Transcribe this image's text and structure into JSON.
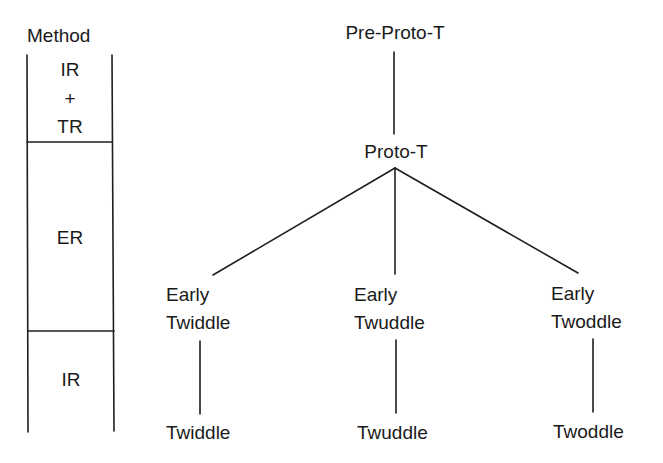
{
  "method_column": {
    "header": "Method",
    "cells": [
      {
        "lines": [
          "IR",
          "+",
          "TR"
        ]
      },
      {
        "lines": [
          "ER"
        ]
      },
      {
        "lines": [
          "IR"
        ]
      }
    ]
  },
  "tree": {
    "root": "Pre-Proto-T",
    "proto": "Proto-T",
    "branches": [
      {
        "early_line1": "Early",
        "early_line2": "Twiddle",
        "leaf": "Twiddle"
      },
      {
        "early_line1": "Early",
        "early_line2": "Twuddle",
        "leaf": "Twuddle"
      },
      {
        "early_line1": "Early",
        "early_line2": "Twoddle",
        "leaf": "Twoddle"
      }
    ]
  },
  "colors": {
    "ink": "#1a1a1a",
    "background": "#ffffff"
  }
}
